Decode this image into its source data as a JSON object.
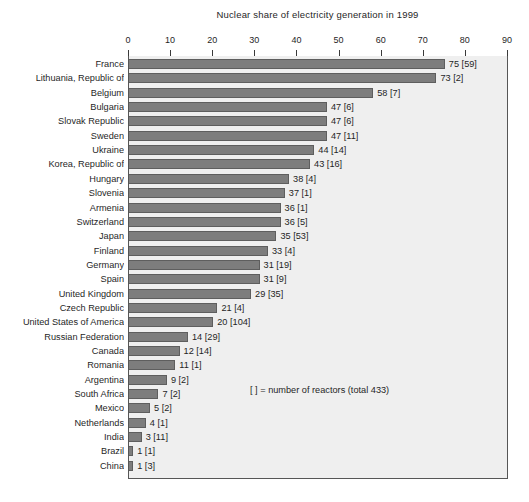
{
  "chart_data": {
    "type": "bar",
    "orientation": "horizontal",
    "title": "Nuclear share of electricity generation in 1999",
    "xlabel": "",
    "ylabel": "",
    "xlim": [
      0,
      90
    ],
    "xticks": [
      0,
      10,
      20,
      30,
      40,
      50,
      60,
      70,
      80,
      90
    ],
    "xtick_labels": [
      "0",
      "10",
      "20",
      "30",
      "40",
      "50",
      "60",
      "70",
      "80",
      "90"
    ],
    "grid": false,
    "legend": null,
    "annotation": "[ ]  = number of reactors (total 433)",
    "bar_color": "#7d7d7d",
    "plot_background": "#efefef",
    "categories": [
      "France",
      "Lithuania, Republic of",
      "Belgium",
      "Bulgaria",
      "Slovak Republic",
      "Sweden",
      "Ukraine",
      "Korea, Republic of",
      "Hungary",
      "Slovenia",
      "Armenia",
      "Switzerland",
      "Japan",
      "Finland",
      "Germany",
      "Spain",
      "United Kingdom",
      "Czech Republic",
      "United States of America",
      "Russian Federation",
      "Canada",
      "Romania",
      "Argentina",
      "South Africa",
      "Mexico",
      "Netherlands",
      "India",
      "Brazil",
      "China"
    ],
    "values": [
      75,
      73,
      58,
      47,
      47,
      47,
      44,
      43,
      38,
      37,
      36,
      36,
      35,
      33,
      31,
      31,
      29,
      21,
      20,
      14,
      12,
      11,
      9,
      7,
      5,
      4,
      3,
      1,
      1
    ],
    "reactors": [
      59,
      2,
      7,
      6,
      6,
      11,
      14,
      16,
      4,
      1,
      1,
      5,
      53,
      4,
      19,
      9,
      35,
      4,
      104,
      29,
      14,
      1,
      2,
      2,
      2,
      1,
      11,
      1,
      3
    ],
    "data_labels": [
      "75  [59]",
      "73  [2]",
      "58  [7]",
      "47  [6]",
      "47  [6]",
      "47  [11]",
      "44  [14]",
      "43  [16]",
      "38  [4]",
      "37  [1]",
      "36  [1]",
      "36  [5]",
      "35  [53]",
      "33  [4]",
      "31  [19]",
      "31  [9]",
      "29  [35]",
      "21  [4]",
      "20  [104]",
      "14  [29]",
      "12  [14]",
      "11  [1]",
      "9  [2]",
      "7  [2]",
      "5  [2]",
      "4  [1]",
      "3  [11]",
      "1  [1]",
      "1  [3]"
    ]
  }
}
